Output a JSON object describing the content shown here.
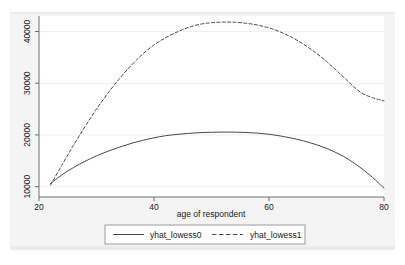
{
  "chart_data": {
    "type": "line",
    "title": "",
    "subtitle": "",
    "xlabel": "age of respondent",
    "ylabel": "",
    "xlim": [
      20,
      80
    ],
    "ylim": [
      8000,
      43000
    ],
    "xticks": [
      20,
      40,
      60,
      80
    ],
    "xtick_labels": [
      "20",
      "40",
      "60",
      "80"
    ],
    "yticks": [
      10000,
      20000,
      30000,
      40000
    ],
    "ytick_labels": [
      "10000",
      "20000",
      "30000",
      "40000"
    ],
    "grid": "horizontal",
    "legend_position": "bottom-center",
    "background_color": "#f4f4f4",
    "plot_background_color": "#ffffff",
    "series": [
      {
        "name": "yhat_lowess0",
        "style": "solid",
        "color": "#4a4a4a",
        "x": [
          22,
          24,
          26,
          28,
          30,
          32,
          34,
          36,
          38,
          40,
          42,
          44,
          46,
          48,
          50,
          52,
          54,
          56,
          58,
          60,
          62,
          64,
          66,
          68,
          70,
          72,
          74,
          76,
          78,
          80
        ],
        "y": [
          10600,
          12300,
          13700,
          14900,
          15950,
          16850,
          17650,
          18350,
          18950,
          19450,
          19850,
          20100,
          20300,
          20450,
          20520,
          20550,
          20540,
          20480,
          20350,
          20130,
          19800,
          19380,
          18850,
          18200,
          17400,
          16400,
          15150,
          13600,
          11800,
          9700
        ]
      },
      {
        "name": "yhat_lowess1",
        "style": "dashed",
        "color": "#4a4a4a",
        "x": [
          22,
          24,
          26,
          28,
          30,
          32,
          34,
          36,
          38,
          40,
          42,
          44,
          46,
          48,
          50,
          52,
          54,
          56,
          58,
          60,
          62,
          64,
          66,
          68,
          70,
          72,
          74,
          76,
          78,
          80
        ],
        "y": [
          10300,
          14200,
          18000,
          21600,
          25000,
          28100,
          30900,
          33400,
          35600,
          37400,
          38800,
          39900,
          40800,
          41400,
          41700,
          41820,
          41800,
          41600,
          41250,
          40700,
          39900,
          38850,
          37550,
          36000,
          34200,
          32200,
          30100,
          28200,
          27200,
          26600
        ]
      }
    ]
  },
  "axis": {
    "x_title": "age of respondent",
    "x_tick_labels": [
      "20",
      "40",
      "60",
      "80"
    ],
    "y_tick_labels": [
      "10000",
      "20000",
      "30000",
      "40000"
    ]
  },
  "legend": {
    "entries": [
      {
        "label": "yhat_lowess0",
        "style": "solid"
      },
      {
        "label": "yhat_lowess1",
        "style": "dashed"
      }
    ]
  }
}
